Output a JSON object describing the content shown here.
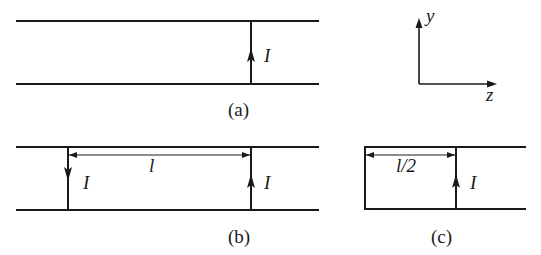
{
  "figure": {
    "panels": [
      {
        "id": "a",
        "caption": "(a)",
        "wires": [
          {
            "label": "I",
            "direction": "up"
          }
        ],
        "dimension": null
      },
      {
        "id": "b",
        "caption": "(b)",
        "wires": [
          {
            "label": "I",
            "direction": "down"
          },
          {
            "label": "I",
            "direction": "up"
          }
        ],
        "dimension": {
          "label": "l"
        }
      },
      {
        "id": "c",
        "caption": "(c)",
        "wires": [
          {
            "label": "I",
            "direction": "up"
          }
        ],
        "dimension": {
          "label": "l/2"
        },
        "closed_end": "left"
      }
    ],
    "axes": {
      "vertical_label": "y",
      "horizontal_label": "z"
    }
  }
}
